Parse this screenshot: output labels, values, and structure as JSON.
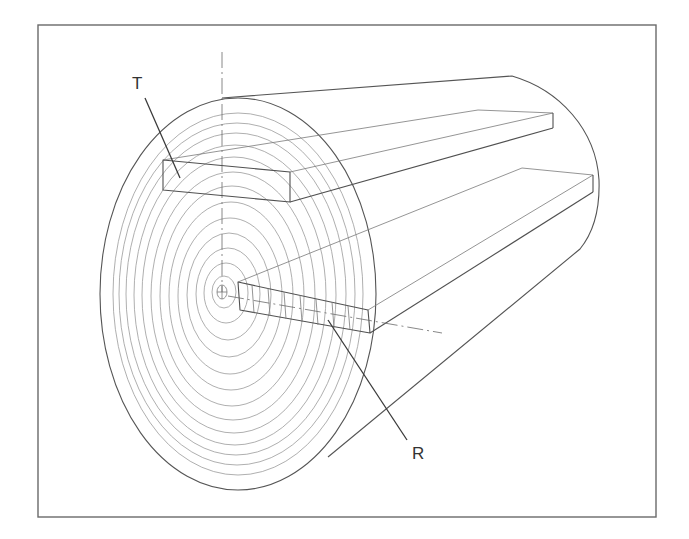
{
  "diagram": {
    "labels": {
      "tangential": "T",
      "radial": "R"
    },
    "colors": {
      "background": "#ffffff",
      "frame": "#6a6a6a",
      "outline": "#555555",
      "growth_rings": "#9a9a9a",
      "label_text": "#333333"
    },
    "growth_ring_count": 14,
    "components": [
      "frame",
      "log-end-face",
      "growth-rings",
      "pith",
      "log-body-outline",
      "tangential-board",
      "radial-board",
      "center-axis"
    ]
  }
}
